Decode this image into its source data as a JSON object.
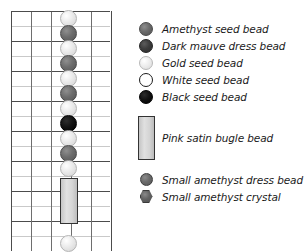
{
  "pattern": {
    "grid": {
      "columns": 5,
      "rows": 16,
      "cell_width": 20,
      "cell_height": 15
    },
    "bead_column_index": 3,
    "beads": [
      {
        "type": "gold-seed-bead",
        "icon": "gold-bead-icon",
        "row": 0
      },
      {
        "type": "amethyst-seed-bead",
        "icon": "amethyst-bead-icon",
        "row": 1
      },
      {
        "type": "gold-seed-bead",
        "icon": "gold-bead-icon",
        "row": 2
      },
      {
        "type": "amethyst-seed-bead",
        "icon": "amethyst-bead-icon",
        "row": 3
      },
      {
        "type": "gold-seed-bead",
        "icon": "gold-bead-icon",
        "row": 4
      },
      {
        "type": "amethyst-seed-bead",
        "icon": "amethyst-bead-icon",
        "row": 5
      },
      {
        "type": "gold-seed-bead",
        "icon": "gold-bead-icon",
        "row": 6
      },
      {
        "type": "black-seed-bead",
        "icon": "black-bead-icon",
        "row": 7
      },
      {
        "type": "gold-seed-bead",
        "icon": "gold-bead-icon",
        "row": 8
      },
      {
        "type": "amethyst-seed-bead",
        "icon": "amethyst-bead-icon",
        "row": 9
      },
      {
        "type": "gold-seed-bead",
        "icon": "gold-bead-icon",
        "row": 10
      },
      {
        "type": "pink-satin-bugle-bead",
        "icon": "bugle-bead-icon",
        "row": 11,
        "span": 3
      },
      {
        "type": "gold-seed-bead",
        "icon": "gold-bead-icon",
        "row": 15
      }
    ]
  },
  "legend": {
    "items": [
      {
        "icon": "amethyst-seed-bead-icon",
        "swatch": "circle",
        "label": "Amethyst seed bead"
      },
      {
        "icon": "dark-mauve-dress-bead-icon",
        "swatch": "circle",
        "label": "Dark mauve dress bead"
      },
      {
        "icon": "gold-seed-bead-icon",
        "swatch": "circle",
        "label": "Gold seed bead"
      },
      {
        "icon": "white-seed-bead-icon",
        "swatch": "circle",
        "label": "White seed bead"
      },
      {
        "icon": "black-seed-bead-icon",
        "swatch": "circle",
        "label": "Black seed bead"
      }
    ],
    "bugle": {
      "icon": "pink-satin-bugle-bead-icon",
      "swatch": "rectangle",
      "label": "Pink satin bugle bead"
    },
    "small_items": [
      {
        "icon": "small-amethyst-dress-bead-icon",
        "swatch": "circle",
        "label": "Small amethyst dress bead"
      },
      {
        "icon": "small-amethyst-crystal-icon",
        "swatch": "hexagon",
        "label": "Small amethyst crystal"
      }
    ]
  },
  "colors": {
    "grid_major_line": "#4c4c4c",
    "grid_minor_line": "#c9c9c9",
    "grid_vertical_line": "#6e6e6e",
    "amethyst": "#6d6d6d",
    "dark_mauve": "#3d3d3d",
    "gold": "#ececec",
    "white": "#ffffff",
    "black": "#000000",
    "pink_satin": "#d6d6d6",
    "text": "#1a1a1a"
  }
}
